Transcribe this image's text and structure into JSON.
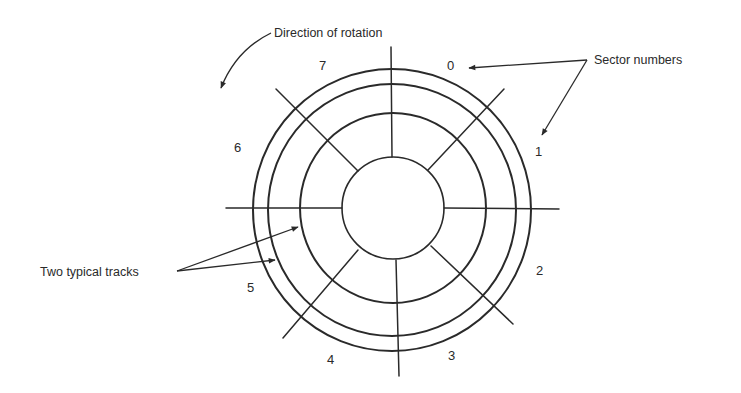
{
  "diagram": {
    "annotations": {
      "rotation": "Direction of rotation",
      "sectors": "Sector numbers",
      "tracks": "Two typical tracks"
    },
    "sector_labels": [
      "0",
      "1",
      "2",
      "3",
      "4",
      "5",
      "6",
      "7"
    ],
    "sector_count": 8,
    "rings": [
      {
        "name": "outer-edge",
        "radius": 139
      },
      {
        "name": "track-a",
        "radius": 124
      },
      {
        "name": "track-b",
        "radius": 93
      },
      {
        "name": "hub",
        "radius": 51
      }
    ],
    "line_color": "#2a2a2a",
    "background": "#ffffff"
  }
}
